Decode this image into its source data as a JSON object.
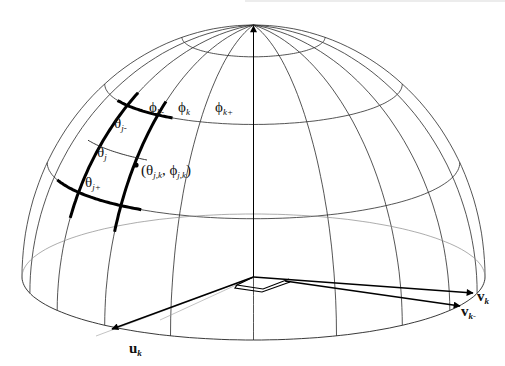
{
  "figure": {
    "type": "hemisphere-grid-diagram"
  },
  "labels": {
    "phi_k_minus": {
      "sym": "ϕ",
      "sub": "k-"
    },
    "phi_k": {
      "sym": "ϕ",
      "sub": "k"
    },
    "phi_k_plus": {
      "sym": "ϕ",
      "sub": "k+"
    },
    "theta_j_minus": {
      "sym": "θ",
      "sub": "j-"
    },
    "theta_j": {
      "sym": "θ",
      "sub": "j"
    },
    "theta_j_plus": {
      "sym": "θ",
      "sub": "j+"
    },
    "point": {
      "open": "(",
      "sym1": "θ",
      "sub1": "j,k",
      "sep": ", ",
      "sym2": "ϕ",
      "sub2": "j,k",
      "close": ")"
    },
    "u_k": {
      "sym": "u",
      "sub": "k"
    },
    "v_k": {
      "sym": "v",
      "sub": "k"
    },
    "v_k_minus": {
      "sym": "v",
      "sub": "k-"
    }
  },
  "colors": {
    "line": "#222222",
    "faint": "#888888",
    "heavy": "#000000"
  }
}
